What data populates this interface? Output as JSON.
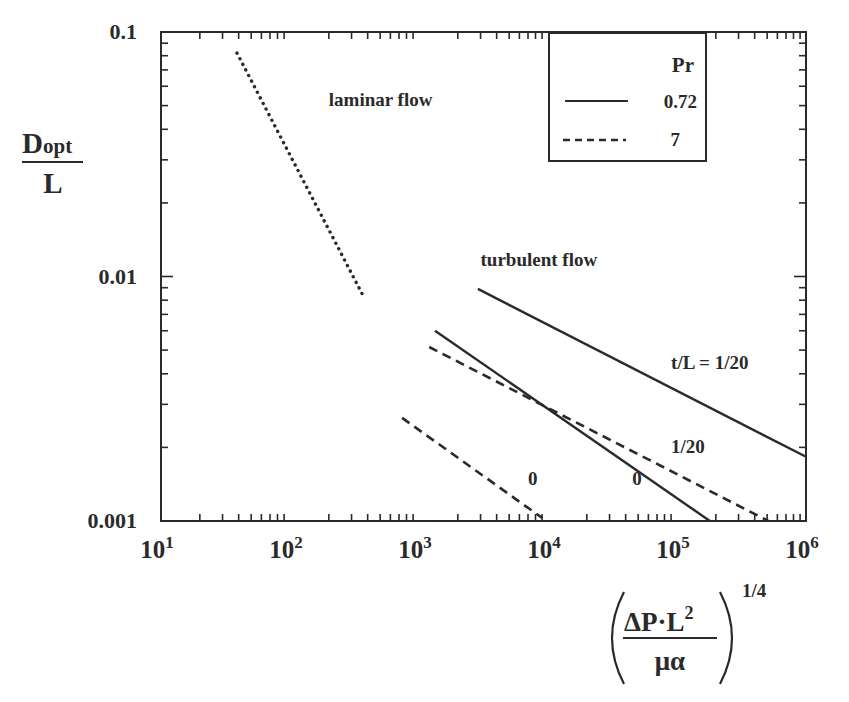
{
  "chart_data": {
    "type": "line",
    "title": "",
    "xscale": "log",
    "yscale": "log",
    "xlim": [
      10,
      1000000
    ],
    "ylim": [
      0.001,
      0.1
    ],
    "grid": false,
    "xlabel": {
      "numerator": "ΔP·L",
      "numerator_sup": "2",
      "denominator": "μα",
      "exponent": "1/4"
    },
    "ylabel": {
      "numerator": "D",
      "numerator_sub": "opt",
      "denominator": "L"
    },
    "x_ticks": [
      {
        "base": "10",
        "exp": "1",
        "value": 10
      },
      {
        "base": "10",
        "exp": "2",
        "value": 100
      },
      {
        "base": "10",
        "exp": "3",
        "value": 1000
      },
      {
        "base": "10",
        "exp": "4",
        "value": 10000
      },
      {
        "base": "10",
        "exp": "5",
        "value": 100000
      },
      {
        "base": "10",
        "exp": "6",
        "value": 1000000
      }
    ],
    "y_ticks": [
      {
        "label": "0.1",
        "value": 0.1
      },
      {
        "label": "0.01",
        "value": 0.01
      },
      {
        "label": "0.001",
        "value": 0.001
      }
    ],
    "legend": {
      "title": "Pr",
      "position": "top-right",
      "entries": [
        {
          "label": "0.72",
          "style": "solid"
        },
        {
          "label": "7",
          "style": "dashed"
        }
      ]
    },
    "series": [
      {
        "name": "laminar flow",
        "style": "dotted",
        "x": [
          38.8,
          375
        ],
        "y": [
          0.082,
          0.0082
        ]
      },
      {
        "name": "turbulent, Pr=0.72, t/L=1/20",
        "style": "solid",
        "x": [
          2860,
          1000000
        ],
        "y": [
          0.0089,
          0.00183
        ]
      },
      {
        "name": "turbulent, Pr=0.72, t/L=0",
        "style": "solid",
        "x": [
          1330,
          180000
        ],
        "y": [
          0.006,
          0.001
        ]
      },
      {
        "name": "turbulent, Pr=7, t/L=1/20",
        "style": "dashed",
        "x": [
          1200,
          510000
        ],
        "y": [
          0.00515,
          0.001
        ]
      },
      {
        "name": "turbulent, Pr=7, t/L=0",
        "style": "dashed",
        "x": [
          740,
          9000
        ],
        "y": [
          0.00264,
          0.00103
        ]
      }
    ],
    "annotations": [
      {
        "text": "laminar flow",
        "x": 200,
        "y": 0.05
      },
      {
        "text": "turbulent flow",
        "x": 3000,
        "y": 0.011
      },
      {
        "text": "t/L = 1/20",
        "x": 90000,
        "y": 0.0042
      },
      {
        "text": "1/20",
        "x": 90000,
        "y": 0.0019
      },
      {
        "text": "0",
        "x": 7000,
        "y": 0.0014
      },
      {
        "text": "0",
        "x": 45000,
        "y": 0.0014
      }
    ]
  }
}
